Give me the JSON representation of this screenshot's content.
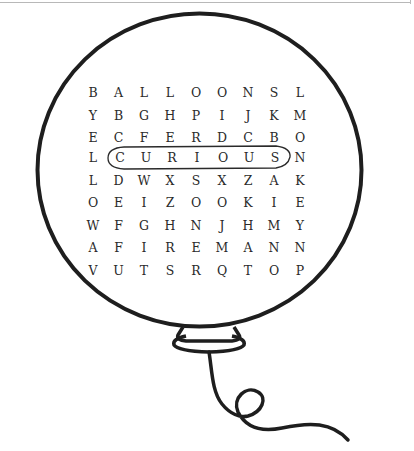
{
  "puzzle": {
    "type": "word-search",
    "shape": "balloon",
    "grid": [
      [
        "B",
        "A",
        "L",
        "L",
        "O",
        "O",
        "N",
        "S",
        "L"
      ],
      [
        "Y",
        "B",
        "G",
        "H",
        "P",
        "I",
        "J",
        "K",
        "M"
      ],
      [
        "E",
        "C",
        "F",
        "E",
        "R",
        "D",
        "C",
        "B",
        "O"
      ],
      [
        "L",
        "C",
        "U",
        "R",
        "I",
        "O",
        "U",
        "S",
        "N"
      ],
      [
        "L",
        "D",
        "W",
        "X",
        "S",
        "X",
        "Z",
        "A",
        "K"
      ],
      [
        "O",
        "E",
        "I",
        "Z",
        "O",
        "O",
        "K",
        "I",
        "E"
      ],
      [
        "W",
        "F",
        "G",
        "H",
        "N",
        "J",
        "H",
        "M",
        "Y"
      ],
      [
        "A",
        "F",
        "I",
        "R",
        "E",
        "M",
        "A",
        "N",
        "N"
      ],
      [
        "V",
        "U",
        "T",
        "S",
        "R",
        "Q",
        "T",
        "O",
        "P"
      ]
    ],
    "circled_words": [
      {
        "word": "CURIOUS",
        "row": 3,
        "col_start": 1,
        "col_end": 7,
        "direction": "horizontal"
      }
    ]
  },
  "colors": {
    "ink": "#1e1e1e",
    "letters": "#2a2a2a",
    "background": "#ffffff",
    "frame": "#b8b8b8"
  }
}
